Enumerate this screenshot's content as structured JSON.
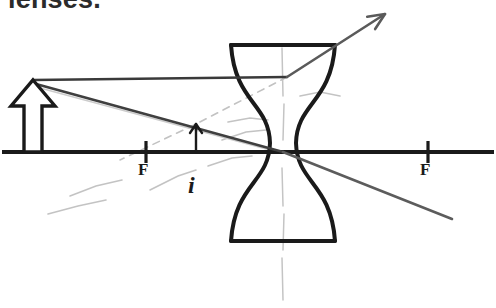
{
  "page": {
    "width": 496,
    "height": 308,
    "background": "#ffffff",
    "heading": "lenses.",
    "heading_color": "#2b2b2b",
    "ink_color": "#1a1a1a",
    "ray_color": "#4a4a4a",
    "faint_color": "#b9b9b9"
  },
  "diagram": {
    "type": "optics-ray-diagram",
    "lens_type": "diverging-concave",
    "principal_axis": {
      "label": "principal-axis",
      "y": 152,
      "x_start": 2,
      "x_end": 494,
      "thickness": 4
    },
    "lens": {
      "label": "concave-lens",
      "center_x": 283,
      "top_y": 45,
      "bottom_y": 241,
      "top_half_width": 52,
      "waist_half_width": 13,
      "stroke": 4
    },
    "optical_center": {
      "x": 283,
      "y": 152
    },
    "focal_points": [
      {
        "name": "F-left",
        "label": "F",
        "x": 146,
        "y": 152,
        "label_x": 138,
        "label_y": 160
      },
      {
        "name": "F-right",
        "label": "F",
        "x": 428,
        "y": 152,
        "label_x": 420,
        "label_y": 160
      }
    ],
    "object": {
      "name": "object-arrow",
      "style": "hollow-outline",
      "base_x": 33,
      "base_y": 152,
      "tip_x": 33,
      "tip_y": 80,
      "shaft_half_width": 9,
      "head_half_width": 22,
      "head_height": 26
    },
    "image": {
      "name": "image-arrow",
      "label": "i",
      "style": "solid-thin",
      "base_x": 196,
      "base_y": 152,
      "tip_x": 196,
      "tip_y": 124,
      "label_x": 188,
      "label_y": 172
    },
    "rays": [
      {
        "name": "incident-parallel-ray",
        "description": "horizontal ray from object tip to lens",
        "points": [
          [
            33,
            80
          ],
          [
            287,
            77
          ]
        ],
        "color": "#3a3a3a",
        "width": 2.4,
        "dashed": false
      },
      {
        "name": "refracted-diverging-ray",
        "description": "ray diverging upward-right after lens, with arrowhead",
        "points": [
          [
            287,
            77
          ],
          [
            385,
            14
          ]
        ],
        "color": "#5a5a5a",
        "width": 2.6,
        "dashed": false,
        "arrowhead": true
      },
      {
        "name": "incident-center-ray",
        "description": "ray from object tip through optical center",
        "points": [
          [
            36,
            84
          ],
          [
            283,
            152
          ]
        ],
        "color": "#3f3f3f",
        "width": 2.6,
        "dashed": false
      },
      {
        "name": "undeviated-center-ray",
        "description": "continues straight past the optical center, down-right",
        "points": [
          [
            283,
            152
          ],
          [
            452,
            219
          ]
        ],
        "color": "#5c5c5c",
        "width": 2.6,
        "dashed": false
      },
      {
        "name": "virtual-ray-extension",
        "description": "faint back-extension of the refracted ray toward the image tip",
        "points": [
          [
            287,
            77
          ],
          [
            196,
            124
          ],
          [
            120,
            160
          ]
        ],
        "color": "#c2c2c2",
        "width": 1.6,
        "dashed": true
      },
      {
        "name": "faint-construction-ray",
        "description": "faint erased construction line from object toward lens waist",
        "points": [
          [
            40,
            88
          ],
          [
            270,
            150
          ]
        ],
        "color": "#cccccc",
        "width": 1.4,
        "dashed": false
      }
    ],
    "lens_axis_dashes": {
      "name": "lens-vertical-dashed-axis",
      "x": 283,
      "segments": [
        [
          48,
          96
        ],
        [
          104,
          140
        ],
        [
          168,
          206
        ],
        [
          214,
          250
        ],
        [
          258,
          300
        ]
      ],
      "color": "#c4c4c4",
      "width": 1.5
    },
    "smudges": [
      {
        "name": "eraser-smudge-lower-left",
        "points": [
          [
            48,
            214
          ],
          [
            78,
            206
          ],
          [
            106,
            200
          ]
        ]
      },
      {
        "name": "eraser-smudge-left",
        "points": [
          [
            70,
            196
          ],
          [
            96,
            186
          ],
          [
            122,
            180
          ]
        ]
      },
      {
        "name": "eraser-smudge-below-axis",
        "points": [
          [
            150,
            190
          ],
          [
            178,
            176
          ],
          [
            196,
            170
          ]
        ]
      },
      {
        "name": "eraser-smudge-near-lens",
        "points": [
          [
            208,
            166
          ],
          [
            232,
            158
          ],
          [
            252,
            156
          ]
        ]
      },
      {
        "name": "eraser-smudge-above-axis",
        "points": [
          [
            222,
            140
          ],
          [
            246,
            132
          ],
          [
            266,
            130
          ]
        ]
      },
      {
        "name": "eraser-smudge-upper",
        "points": [
          [
            228,
            122
          ],
          [
            250,
            118
          ],
          [
            268,
            120
          ]
        ]
      },
      {
        "name": "eraser-smudge-top-right",
        "points": [
          [
            300,
            96
          ],
          [
            320,
            92
          ],
          [
            340,
            96
          ]
        ]
      }
    ]
  }
}
